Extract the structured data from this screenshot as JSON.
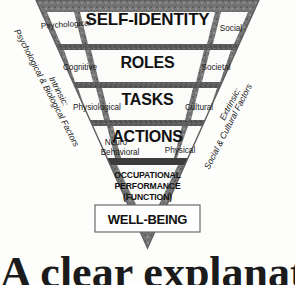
{
  "diagram": {
    "colors": {
      "frame": "#6f6f6f",
      "frame_dark": "#4a4a4a",
      "cell_fill": "#fbfbfa",
      "text": "#111111",
      "background": "#fdfdfc"
    },
    "tiers": [
      {
        "center": "SELF-IDENTITY",
        "left": "Psychological",
        "right": "Social"
      },
      {
        "center": "ROLES",
        "left": "Cognitive",
        "right": "Societal"
      },
      {
        "center": "TASKS",
        "left": "Physiological",
        "right": "Cultural"
      },
      {
        "center": "ACTIONS",
        "left_line1": "Neuro",
        "left_line2": "Behavioral",
        "right": "Physical"
      }
    ],
    "outcome": {
      "line1": "OCCUPATIONAL",
      "line2": "PERFORMANCE",
      "line3": "(FUNCTION)"
    },
    "result_box": {
      "label": "WELL-BEING"
    },
    "axes": {
      "left_line1": "Intrinsic:",
      "left_line2": "Psychological & Biological Factors",
      "right_line1": "Extrinsic:",
      "right_line2": "Social & Cultural Factors"
    },
    "caption": {
      "text": "A clear explanation"
    }
  }
}
